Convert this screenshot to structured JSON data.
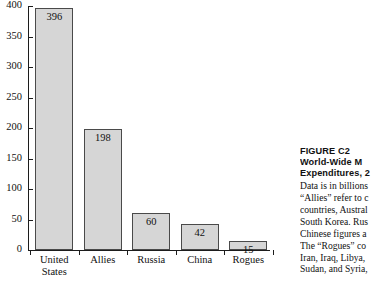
{
  "chart_data": {
    "type": "bar",
    "title": "",
    "xlabel": "",
    "ylabel": "",
    "categories": [
      "United States",
      "Allies",
      "Russia",
      "China",
      "Rogues"
    ],
    "values": [
      396,
      198,
      60,
      42,
      15
    ],
    "data_labels": [
      "396",
      "198",
      "60",
      "42",
      "15"
    ],
    "ylim": [
      0,
      400
    ],
    "ytick_values": [
      0,
      50,
      100,
      150,
      200,
      250,
      300,
      350,
      400
    ],
    "ytick_labels": [
      "0",
      "50",
      "100",
      "150",
      "200",
      "250",
      "300",
      "350",
      "400"
    ],
    "grid": false,
    "legend": false,
    "bar_fill": "#d6d6d6",
    "bar_stroke": "#4a4a4a",
    "axis_color": "#1c1c1c"
  },
  "caption": {
    "figure_number": "FIGURE C2",
    "title_line1": "World-Wide M",
    "title_line2": "Expenditures, 2",
    "body_lines": [
      "Data is in billions",
      "“Allies” refer to c",
      "countries, Austral",
      "South Korea. Rus",
      "Chinese figures a",
      "The “Rogues” co",
      "Iran, Iraq, Libya, ",
      "Sudan, and Syria,"
    ]
  }
}
